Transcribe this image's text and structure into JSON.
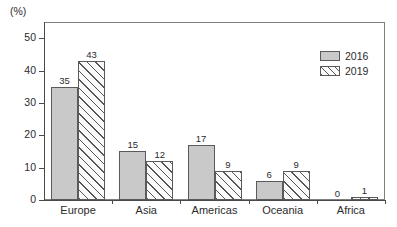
{
  "chart_data": {
    "type": "bar",
    "title": "",
    "xlabel": "",
    "ylabel": "(%)",
    "unit_label": "(%)",
    "categories": [
      "Europe",
      "Asia",
      "Americas",
      "Oceania",
      "Africa"
    ],
    "series": [
      {
        "name": "2016",
        "values": [
          35,
          15,
          17,
          6,
          0
        ],
        "style": "solid-gray"
      },
      {
        "name": "2019",
        "values": [
          43,
          12,
          9,
          9,
          1
        ],
        "style": "diagonal-hatch"
      }
    ],
    "ylim": [
      0,
      55
    ],
    "yticks": [
      0,
      10,
      20,
      30,
      40,
      50
    ],
    "ytick_labels": [
      "0",
      "10",
      "20",
      "30",
      "40",
      "50"
    ],
    "grid": false,
    "legend_position": "top-right",
    "legend_entries": [
      "2016",
      "2019"
    ],
    "data_labels_shown": true,
    "colors": {
      "series_2016_fill": "#c9c9c9",
      "series_2019_fill": "#fafafa",
      "hatch_line": "#555555",
      "bar_border": "#5a5a5a",
      "axis": "#4a4a4a",
      "frame": "#808080",
      "text": "#2b2b2b",
      "background": "#ffffff"
    }
  }
}
